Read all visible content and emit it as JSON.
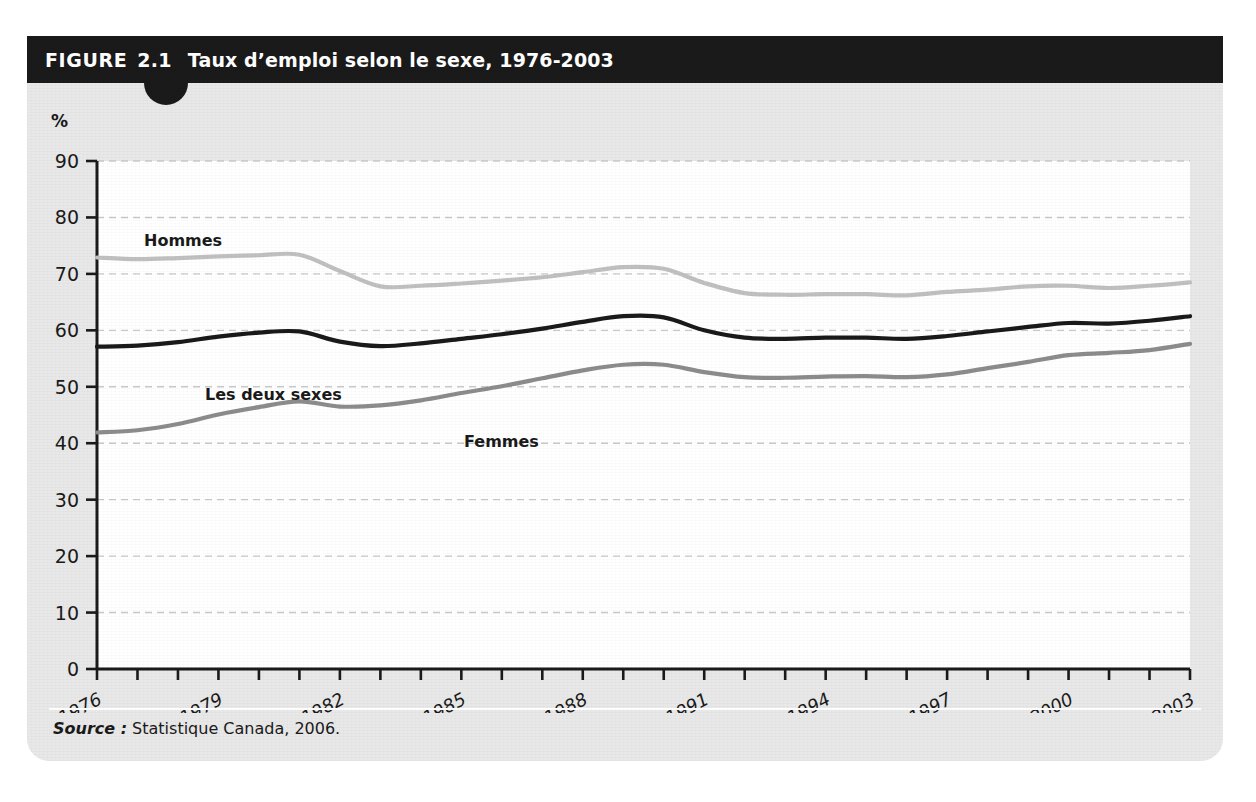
{
  "figure": {
    "label": "FIGURE",
    "number": "2.1",
    "title": "Taux d’emploi selon le sexe, 1976-2003"
  },
  "axis": {
    "unit_label": "%",
    "y_ticks": [
      "90",
      "80",
      "70",
      "60",
      "50",
      "40",
      "30",
      "20",
      "10",
      "0"
    ],
    "x_ticks": [
      "1976",
      "1979",
      "1982",
      "1985",
      "1988",
      "1991",
      "1994",
      "1997",
      "2000",
      "2003"
    ]
  },
  "series_labels": {
    "hommes": "Hommes",
    "les_deux_sexes": "Les deux sexes",
    "femmes": "Femmes"
  },
  "source": {
    "word": "Source :",
    "text": "Statistique Canada, 2006."
  },
  "colors": {
    "header_bar": "#1a1a1a",
    "figure_background": "#e8e8e8",
    "plot_background": "#ffffff",
    "gridline": "#c9c9c9",
    "axis": "#1a1a1a",
    "hommes": "#c0c0c0",
    "les_deux_sexes": "#1a1a1a",
    "femmes": "#8c8c8c"
  },
  "chart_data": {
    "type": "line",
    "title": "Taux d’emploi selon le sexe, 1976-2003",
    "xlabel": "",
    "ylabel": "%",
    "ylim": [
      0,
      90
    ],
    "xlim": [
      1976,
      2003
    ],
    "grid": true,
    "legend": "inline-labels",
    "x": [
      1976,
      1977,
      1978,
      1979,
      1980,
      1981,
      1982,
      1983,
      1984,
      1985,
      1986,
      1987,
      1988,
      1989,
      1990,
      1991,
      1992,
      1993,
      1994,
      1995,
      1996,
      1997,
      1998,
      1999,
      2000,
      2001,
      2002,
      2003
    ],
    "series": [
      {
        "name": "Hommes",
        "color": "#c0c0c0",
        "values": [
          72.9,
          72.6,
          72.8,
          73.1,
          73.3,
          73.4,
          70.5,
          67.8,
          67.9,
          68.3,
          68.8,
          69.4,
          70.3,
          71.2,
          70.9,
          68.4,
          66.6,
          66.3,
          66.4,
          66.4,
          66.2,
          66.8,
          67.2,
          67.8,
          67.9,
          67.5,
          67.9,
          68.5
        ]
      },
      {
        "name": "Les deux sexes",
        "color": "#1a1a1a",
        "values": [
          57.1,
          57.3,
          57.9,
          58.9,
          59.6,
          59.8,
          58.0,
          57.2,
          57.7,
          58.5,
          59.3,
          60.3,
          61.5,
          62.5,
          62.3,
          60.0,
          58.7,
          58.5,
          58.7,
          58.7,
          58.5,
          59.0,
          59.8,
          60.6,
          61.3,
          61.2,
          61.7,
          62.5
        ]
      },
      {
        "name": "Femmes",
        "color": "#8c8c8c",
        "values": [
          41.9,
          42.3,
          43.4,
          45.1,
          46.4,
          47.4,
          46.5,
          46.7,
          47.6,
          48.9,
          50.1,
          51.5,
          52.9,
          53.9,
          53.9,
          52.6,
          51.7,
          51.6,
          51.8,
          51.9,
          51.7,
          52.2,
          53.3,
          54.4,
          55.6,
          56.0,
          56.5,
          57.6
        ]
      }
    ]
  }
}
